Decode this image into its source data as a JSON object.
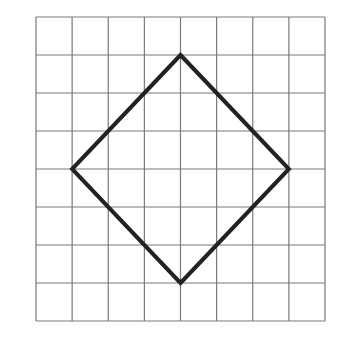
{
  "diagram": {
    "type": "grid-with-polygon",
    "grid": {
      "columns": 8,
      "rows": 8,
      "left": 36,
      "top": 17,
      "right": 325,
      "bottom": 321,
      "line_color": "#7a7a7a",
      "line_width": 1.2
    },
    "shape": {
      "name": "diamond",
      "grid_vertices": [
        [
          4,
          1
        ],
        [
          7,
          4
        ],
        [
          4,
          7
        ],
        [
          1,
          4
        ]
      ],
      "stroke_color": "#222222",
      "stroke_width": 4,
      "fill": "none"
    },
    "background": "#ffffff"
  }
}
